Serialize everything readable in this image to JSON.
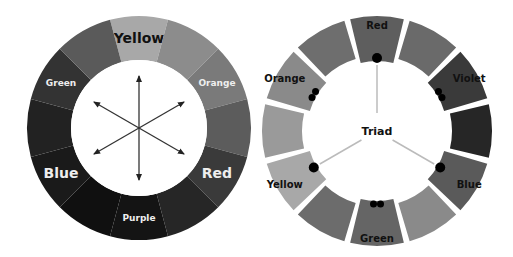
{
  "left_wheel": {
    "title": "Complementary color wheel",
    "segments": [
      {
        "label": "Yellow",
        "shade": "#a8a8a8",
        "label_color": "#111111",
        "label_size": 14
      },
      {
        "label": "",
        "shade": "#8c8c8c"
      },
      {
        "label": "Orange",
        "shade": "#7a7a7a",
        "label_color": "#eeeeee",
        "label_size": 9
      },
      {
        "label": "",
        "shade": "#5c5c5c"
      },
      {
        "label": "Red",
        "shade": "#3a3a3a",
        "label_color": "#eeeeee",
        "label_size": 14
      },
      {
        "label": "",
        "shade": "#262626"
      },
      {
        "label": "Purple",
        "shade": "#141414",
        "label_color": "#eeeeee",
        "label_size": 9
      },
      {
        "label": "",
        "shade": "#101010"
      },
      {
        "label": "Blue",
        "shade": "#1a1a1a",
        "label_color": "#eeeeee",
        "label_size": 14
      },
      {
        "label": "",
        "shade": "#222222"
      },
      {
        "label": "Green",
        "shade": "#333333",
        "label_color": "#eeeeee",
        "label_size": 9
      },
      {
        "label": "",
        "shade": "#5a5a5a"
      }
    ],
    "arrow_axes": 3
  },
  "right_wheel": {
    "center_label": "Triad",
    "segments": [
      {
        "label": "Red",
        "shade": "#5e5e5e",
        "dots": 1
      },
      {
        "label": "",
        "shade": "#6a6a6a",
        "dots": 0
      },
      {
        "label": "Violet",
        "shade": "#3a3a3a",
        "dots": 2
      },
      {
        "label": "",
        "shade": "#262626",
        "dots": 0
      },
      {
        "label": "Blue",
        "shade": "#5a5a5a",
        "dots": 1
      },
      {
        "label": "",
        "shade": "#8a8a8a",
        "dots": 0
      },
      {
        "label": "Green",
        "shade": "#656565",
        "dots": 2
      },
      {
        "label": "",
        "shade": "#6c6c6c",
        "dots": 0
      },
      {
        "label": "Yellow",
        "shade": "#a8a8a8",
        "dots": 1
      },
      {
        "label": "",
        "shade": "#9a9a9a",
        "dots": 0
      },
      {
        "label": "Orange",
        "shade": "#8a8a8a",
        "dots": 2
      },
      {
        "label": "",
        "shade": "#6e6e6e",
        "dots": 0
      }
    ]
  }
}
